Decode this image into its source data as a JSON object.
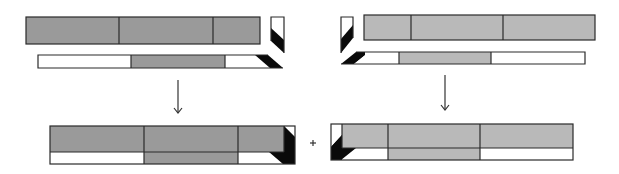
{
  "diagram": {
    "colors": {
      "left_fill": "#9a9a9a",
      "right_fill": "#b9b9b9",
      "end_cut": "#0a0a0a",
      "outline": "#2a2a2a",
      "background": "#ffffff"
    },
    "labels": {
      "plus_symbol": "+"
    },
    "left_fragment": {
      "top_bar_segments": 3,
      "bottom_bar_segments": [
        "white",
        "gray",
        "white"
      ],
      "end_cut_side": "right"
    },
    "right_fragment": {
      "top_bar_segments": 3,
      "bottom_bar_segments": [
        "white",
        "gray",
        "white"
      ],
      "end_cut_side": "left"
    },
    "arrows": 2,
    "result": {
      "left_combined_segments": 3,
      "right_combined_segments": 3,
      "joined_by": "+"
    }
  }
}
